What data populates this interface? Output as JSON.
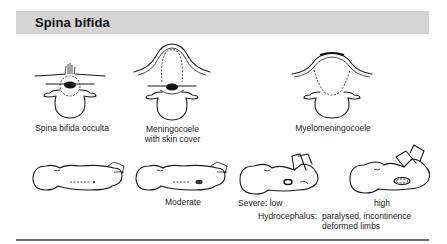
{
  "header": {
    "title": "Spina bifida",
    "background": "#d4d4d4"
  },
  "vertebrae": [
    {
      "id": "occulta",
      "label": "Spina bifida occulta"
    },
    {
      "id": "meningocoele",
      "label_line1": "Meningocoele",
      "label_line2": "with skin cover"
    },
    {
      "id": "myelomeningocoele",
      "label": "Myelomeningocoele"
    }
  ],
  "infants": [
    {
      "id": "normal",
      "label": ""
    },
    {
      "id": "moderate",
      "label": "Moderate"
    },
    {
      "id": "severe-low",
      "label": "Severe:  low"
    },
    {
      "id": "severe-high",
      "label": "high"
    }
  ],
  "caption": {
    "prefix": "Hydrocephalus:",
    "line1": "paralysed,  incontinence",
    "line2": "deformed limbs"
  }
}
